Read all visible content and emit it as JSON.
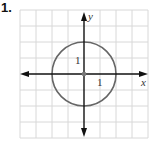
{
  "problem": {
    "number": "1.",
    "x_axis_label": "x",
    "y_axis_label": "y",
    "tick_label_y": "1",
    "tick_label_x": "1"
  },
  "graph": {
    "type": "circle",
    "center": [
      0,
      0
    ],
    "radius": 1,
    "grid_units_per_tick": 0.5,
    "grid_range_x": [
      -2,
      2
    ],
    "grid_range_y": [
      -2,
      2
    ],
    "colors": {
      "grid": "#d8d8d8",
      "axes": "#111111",
      "circle": "#666666"
    }
  }
}
